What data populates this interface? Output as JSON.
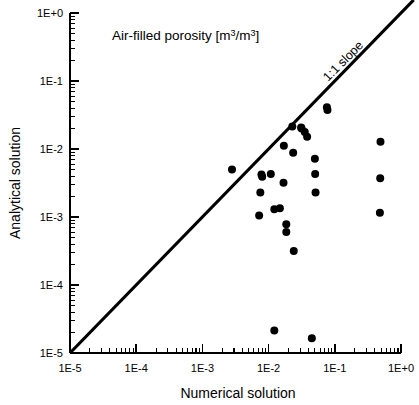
{
  "chart_data": {
    "type": "scatter",
    "title_plain": "Air-filled porosity",
    "title_units": "[m3/m3]",
    "xlabel": "Numerical solution",
    "ylabel": "Analytical solution",
    "xscale": "log",
    "yscale": "log",
    "xlim": [
      1e-05,
      1
    ],
    "ylim": [
      1e-05,
      1
    ],
    "grid": false,
    "legend": "none",
    "xtick_labels": [
      "1E-5",
      "1E-4",
      "1E-3",
      "1E-2",
      "1E-1",
      "1E+0"
    ],
    "ytick_labels": [
      "1E-5",
      "1E-4",
      "1E-3",
      "1E-2",
      "1E-1",
      "1E+0"
    ],
    "xtick_values": [
      1e-05,
      0.0001,
      0.001,
      0.01,
      0.1,
      1
    ],
    "ytick_values": [
      1e-05,
      0.0001,
      0.001,
      0.01,
      0.1,
      1
    ],
    "minor_ticks": true,
    "annotations": [
      {
        "text": "1:1 slope",
        "x": 0.33,
        "y": 0.52,
        "rotation": -45
      }
    ],
    "reference_line": {
      "label": "1:1 slope",
      "type": "identity",
      "from": [
        1e-05,
        1e-05
      ],
      "to": [
        1.6,
        1.6
      ]
    },
    "series": [
      {
        "name": "data",
        "marker": "circle",
        "color": "#000000",
        "points": [
          [
            0.0028,
            0.005
          ],
          [
            0.0078,
            0.0042
          ],
          [
            0.008,
            0.0039
          ],
          [
            0.0075,
            0.0023
          ],
          [
            0.0072,
            0.00105
          ],
          [
            0.0108,
            0.0043
          ],
          [
            0.0122,
            0.0013
          ],
          [
            0.0148,
            0.00135
          ],
          [
            0.017,
            0.0112
          ],
          [
            0.0168,
            0.0032
          ],
          [
            0.0185,
            0.00078
          ],
          [
            0.0185,
            0.0006
          ],
          [
            0.0228,
            0.0215
          ],
          [
            0.0235,
            0.0088
          ],
          [
            0.024,
            0.000315
          ],
          [
            0.031,
            0.0207
          ],
          [
            0.0315,
            0.02
          ],
          [
            0.0352,
            0.0178
          ],
          [
            0.0382,
            0.0152
          ],
          [
            0.05,
            0.0072
          ],
          [
            0.0505,
            0.0043
          ],
          [
            0.0512,
            0.0023
          ],
          [
            0.076,
            0.041
          ],
          [
            0.0775,
            0.0375
          ],
          [
            0.49,
            0.0128
          ],
          [
            0.485,
            0.0037
          ],
          [
            0.48,
            0.00115
          ],
          [
            0.0122,
            2.15e-05
          ],
          [
            0.045,
            1.65e-05
          ]
        ]
      }
    ]
  },
  "figure": {
    "background": "#ffffff",
    "foreground": "#000000"
  }
}
